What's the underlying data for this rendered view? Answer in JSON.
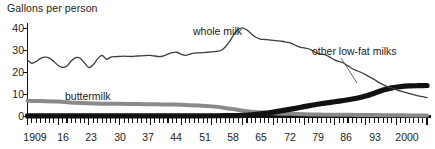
{
  "chart_data": {
    "type": "line",
    "title": "",
    "ylabel": "Gallons per person",
    "xlabel": "",
    "ylim": [
      0,
      43
    ],
    "xlim": [
      1909,
      2000
    ],
    "grid": false,
    "legend_position": "inline-annotations",
    "y_ticks": [
      0,
      10,
      20,
      30,
      40
    ],
    "y_tick_labels": [
      "0",
      "10",
      "20",
      "30",
      "40"
    ],
    "x_ticks": [
      1909,
      1916,
      1923,
      1930,
      1937,
      1944,
      1951,
      1958,
      1965,
      1972,
      1979,
      1986,
      1993,
      2000
    ],
    "x_tick_labels": [
      "1909",
      "16",
      "23",
      "30",
      "37",
      "44",
      "51",
      "58",
      "65",
      "72",
      "79",
      "86",
      "93",
      "2000"
    ],
    "x_minor_tick_interval": 1,
    "series": [
      {
        "name": "whole milk",
        "color": "#3d3d3d",
        "line_width": 1.3,
        "x": [
          1909,
          1910,
          1911,
          1912,
          1913,
          1914,
          1915,
          1916,
          1917,
          1918,
          1919,
          1920,
          1921,
          1922,
          1923,
          1924,
          1925,
          1926,
          1927,
          1928,
          1929,
          1930,
          1931,
          1932,
          1933,
          1934,
          1935,
          1936,
          1937,
          1938,
          1939,
          1940,
          1941,
          1942,
          1943,
          1944,
          1945,
          1946,
          1947,
          1948,
          1949,
          1950,
          1951,
          1952,
          1953,
          1954,
          1955,
          1956,
          1957,
          1958,
          1959,
          1960,
          1961,
          1962,
          1963,
          1964,
          1965,
          1966,
          1967,
          1968,
          1969,
          1970,
          1971,
          1972,
          1973,
          1974,
          1975,
          1976,
          1977,
          1978,
          1979,
          1980,
          1981,
          1982,
          1983,
          1984,
          1985,
          1986,
          1987,
          1988,
          1989,
          1990,
          1991,
          1992,
          1993,
          1994,
          1995,
          1996,
          1997,
          1998,
          1999,
          2000
        ],
        "y": [
          25.5,
          24.2,
          25.0,
          26.4,
          27.0,
          26.5,
          25.0,
          23.2,
          22.3,
          23.0,
          25.3,
          26.8,
          26.5,
          24.3,
          22.2,
          23.6,
          26.3,
          27.8,
          26.0,
          27.0,
          27.2,
          27.3,
          27.4,
          27.3,
          27.3,
          27.5,
          27.6,
          27.7,
          27.8,
          27.5,
          27.2,
          27.6,
          28.4,
          29.0,
          29.2,
          28.3,
          27.8,
          28.4,
          28.8,
          28.9,
          29.0,
          29.2,
          29.4,
          29.6,
          30.0,
          31.5,
          34.0,
          37.2,
          39.6,
          40.3,
          39.3,
          37.5,
          36.0,
          35.2,
          35.0,
          34.8,
          34.6,
          34.4,
          34.2,
          33.8,
          33.4,
          32.4,
          31.5,
          31.2,
          30.8,
          29.8,
          28.7,
          28.3,
          27.9,
          26.8,
          25.6,
          25.0,
          24.3,
          23.0,
          21.7,
          20.8,
          20.0,
          19.0,
          17.9,
          16.8,
          15.5,
          14.5,
          13.6,
          12.9,
          12.2,
          11.5,
          11.0,
          10.4,
          9.9,
          9.4,
          9.0,
          8.6
        ]
      },
      {
        "name": "buttermilk",
        "color": "#8a8a8a",
        "line_width": 4.0,
        "x": [
          1909,
          1912,
          1916,
          1920,
          1924,
          1928,
          1932,
          1936,
          1940,
          1944,
          1948,
          1951,
          1954,
          1957,
          1960,
          1963,
          1966,
          1969,
          1972,
          1975,
          1978,
          1981,
          1984,
          1987,
          1990,
          1993,
          1996,
          2000
        ],
        "y": [
          7.2,
          7.0,
          6.8,
          6.2,
          5.9,
          5.8,
          5.7,
          5.6,
          5.5,
          5.3,
          5.0,
          4.6,
          3.9,
          3.0,
          2.2,
          1.7,
          1.4,
          1.2,
          1.0,
          0.9,
          0.8,
          0.8,
          0.7,
          0.7,
          0.6,
          0.6,
          0.5,
          0.5
        ]
      },
      {
        "name": "other low-fat milks",
        "color": "#111111",
        "line_width": 5.2,
        "x": [
          1909,
          1930,
          1945,
          1952,
          1956,
          1958,
          1960,
          1962,
          1964,
          1966,
          1968,
          1970,
          1972,
          1974,
          1976,
          1978,
          1980,
          1982,
          1984,
          1986,
          1988,
          1990,
          1992,
          1994,
          1996,
          1998,
          2000
        ],
        "y": [
          0.25,
          0.25,
          0.3,
          0.35,
          0.4,
          0.5,
          0.8,
          1.2,
          1.7,
          2.3,
          3.0,
          3.7,
          4.5,
          5.2,
          5.9,
          6.4,
          7.0,
          7.6,
          8.3,
          9.3,
          10.6,
          12.0,
          13.0,
          13.6,
          13.9,
          14.0,
          14.1
        ]
      }
    ],
    "annotations": [
      {
        "id": "whole-milk",
        "text": "whole milk",
        "x_px": 193,
        "y_px": 25
      },
      {
        "id": "buttermilk",
        "text": "buttermilk",
        "x_px": 65,
        "y_px": 90
      },
      {
        "id": "other-low-fat-milks",
        "text": "other low-fat milks",
        "x_px": 312,
        "y_px": 45,
        "leader_line": {
          "from_x_px": 341,
          "from_y_px": 58,
          "to_x_px": 357,
          "to_y_px": 83
        }
      }
    ]
  },
  "labels": {
    "axis_title": "Gallons per person",
    "whole_milk": "whole milk",
    "buttermilk": "buttermilk",
    "other_low_fat_milks": "other low-fat milks",
    "y0": "0",
    "y10": "10",
    "y20": "20",
    "y30": "30",
    "y40": "40",
    "x1909": "1909",
    "x16": "16",
    "x23": "23",
    "x30": "30",
    "x37": "37",
    "x44": "44",
    "x51": "51",
    "x58": "58",
    "x65": "65",
    "x72": "72",
    "x79": "79",
    "x86": "86",
    "x93": "93",
    "x2000": "2000"
  },
  "colors": {
    "whole_milk": "#3d3d3d",
    "buttermilk": "#8a8a8a",
    "other_low_fat_milks": "#111111",
    "axis": "#111111",
    "background": "#ffffff"
  }
}
